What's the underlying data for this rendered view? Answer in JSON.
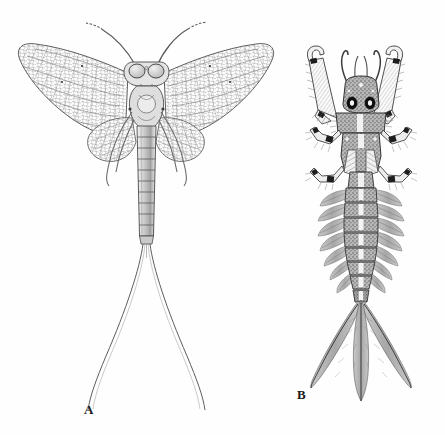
{
  "plate": {
    "title": "Mayfly (Ephemeroptera) comparative plate",
    "background_color": "#fefefe",
    "ink_color": "#2b2b2b",
    "width": 445,
    "height": 435
  },
  "figures": [
    {
      "label": "A",
      "name": "adult-mayfly",
      "caption": "A",
      "stage": "adult imago, dorsal view",
      "label_position": {
        "x": 84,
        "y": 402
      },
      "anatomy": {
        "eyes": {
          "count": 2,
          "description": "large pale compound eyes",
          "color": "#d8d8d8"
        },
        "forelegs": {
          "count": 2,
          "description": "long forelegs held forward in a V"
        },
        "forewings": {
          "count": 2,
          "description": "large triangular forewings with dense reticulate venation"
        },
        "hindwings": {
          "count": 2,
          "description": "small rounded hindwings"
        },
        "abdomen_segments": 10,
        "cerci": {
          "count": 2,
          "description": "two very long outward-curving caudal filaments"
        },
        "legs": {
          "count": 6
        }
      }
    },
    {
      "label": "B",
      "name": "mayfly-nymph",
      "caption": "B",
      "stage": "nymph / larva, dorsal view",
      "label_position": {
        "x": 297,
        "y": 387
      },
      "anatomy": {
        "eyes": {
          "count": 2,
          "description": "round black compound eyes",
          "color": "#111111"
        },
        "mandibular_tusks": {
          "count": 2,
          "description": "pair of long curved mandibular tusks"
        },
        "antennae": {
          "count": 2,
          "description": "short slender antennae between the tusks"
        },
        "forelegs": {
          "count": 2,
          "description": "broad flattened hairy fossorial forelegs spread laterally"
        },
        "midlegs": {
          "count": 2
        },
        "hindlegs": {
          "count": 2
        },
        "abdomen_segments": 8,
        "gills": {
          "pairs": 7,
          "description": "feathery lateral abdominal gills"
        },
        "caudal_filaments": {
          "count": 3,
          "description": "three broad fringed tail filaments"
        }
      }
    }
  ],
  "colors": {
    "ink": "#2b2b2b",
    "mid_gray": "#8e8e8e",
    "light_gray": "#cfcfcf",
    "fill_gray": "#9a9a9a",
    "eye_dark": "#101010",
    "eye_pale": "#dcdcdc",
    "paper": "#fefefe"
  }
}
